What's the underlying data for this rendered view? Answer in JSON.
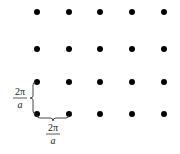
{
  "diagram": {
    "dot_color": "#000000",
    "columns_x": [
      37,
      69,
      100,
      132,
      164
    ],
    "rows_y": [
      12,
      49,
      82,
      114
    ],
    "dot_radius": 3,
    "vertical_spacing_label": {
      "numerator": "2π",
      "denominator": "a"
    },
    "horizontal_spacing_label": {
      "numerator": "2π",
      "denominator": "a"
    }
  }
}
